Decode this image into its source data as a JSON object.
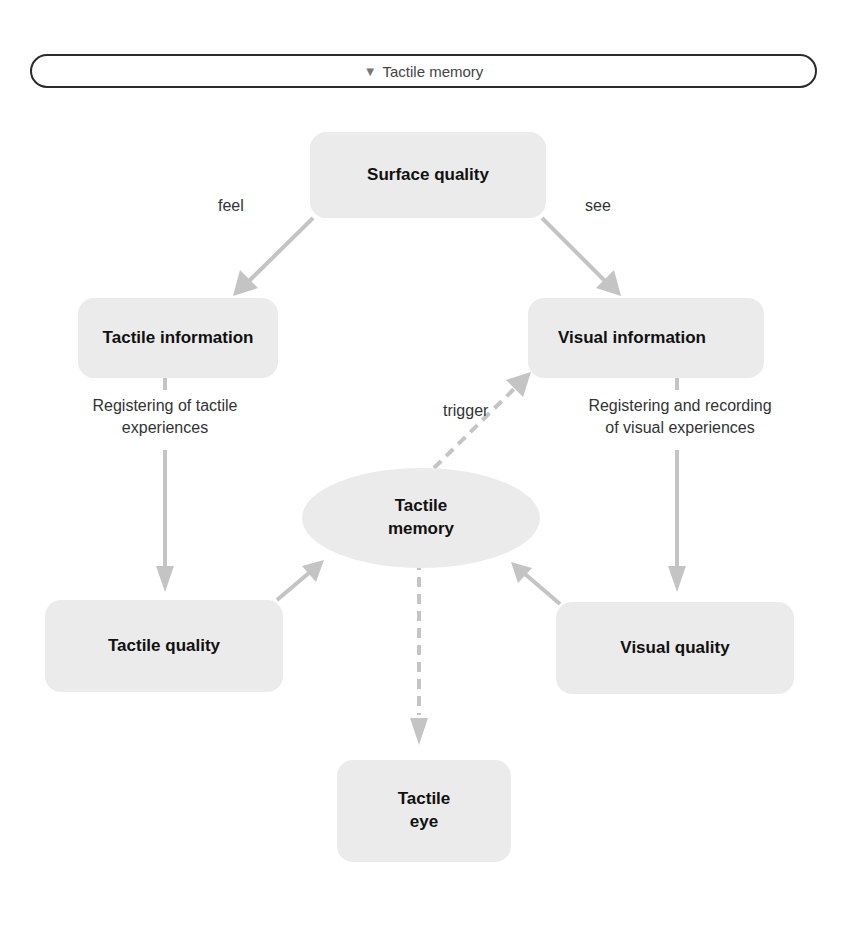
{
  "header": {
    "icon": "▼",
    "title": "Tactile memory"
  },
  "nodes": {
    "surface_quality": "Surface quality",
    "tactile_information": "Tactile information",
    "visual_information": "Visual information",
    "tactile_memory_line1": "Tactile",
    "tactile_memory_line2": "memory",
    "tactile_quality": "Tactile quality",
    "visual_quality": "Visual quality",
    "tactile_eye_line1": "Tactile",
    "tactile_eye_line2": "eye"
  },
  "edge_labels": {
    "feel": "feel",
    "see": "see",
    "trigger": "trigger",
    "registering_tactile_line1": "Registering of tactile",
    "registering_tactile_line2": "experiences",
    "registering_visual_line1": "Registering and recording",
    "registering_visual_line2": "of visual experiences"
  },
  "colors": {
    "node_fill": "#ebebeb",
    "arrow": "#c4c4c4",
    "border": "#2a2a2a"
  }
}
